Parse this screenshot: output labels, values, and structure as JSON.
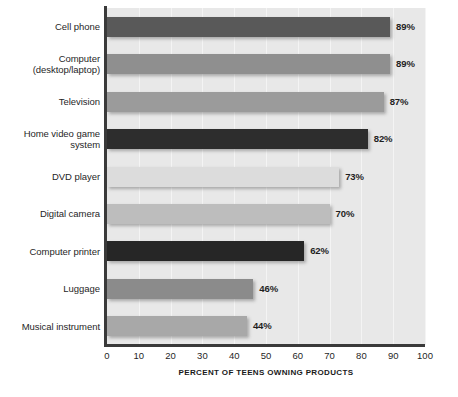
{
  "chart_data": {
    "type": "bar",
    "orientation": "horizontal",
    "title": "",
    "xlabel": "PERCENT OF TEENS OWNING PRODUCTS",
    "ylabel": "",
    "xlim": [
      0,
      100
    ],
    "xticks": [
      "0",
      "10",
      "20",
      "30",
      "40",
      "50",
      "60",
      "70",
      "80",
      "90",
      "100"
    ],
    "grid": true,
    "legend": "none",
    "value_suffix": "%",
    "categories": [
      "Cell phone",
      "Computer (desktop/laptop)",
      "Television",
      "Home video game system",
      "DVD player",
      "Digital camera",
      "Computer printer",
      "Luggage",
      "Musical instrument"
    ],
    "values": [
      89,
      89,
      87,
      82,
      73,
      70,
      62,
      46,
      44
    ],
    "value_labels": [
      "89%",
      "89%",
      "87%",
      "82%",
      "73%",
      "70%",
      "62%",
      "46%",
      "44%"
    ],
    "bars": [
      {
        "label_lines": [
          "Cell phone"
        ],
        "value": 89,
        "value_label": "89%",
        "color": "#595959"
      },
      {
        "label_lines": [
          "Computer",
          "(desktop/laptop)"
        ],
        "value": 89,
        "value_label": "89%",
        "color": "#8f8f8f"
      },
      {
        "label_lines": [
          "Television"
        ],
        "value": 87,
        "value_label": "87%",
        "color": "#9b9b9b"
      },
      {
        "label_lines": [
          "Home video game",
          "system"
        ],
        "value": 82,
        "value_label": "82%",
        "color": "#2d2d2d"
      },
      {
        "label_lines": [
          "DVD player"
        ],
        "value": 73,
        "value_label": "73%",
        "color": "#dcdcdc"
      },
      {
        "label_lines": [
          "Digital camera"
        ],
        "value": 70,
        "value_label": "70%",
        "color": "#bdbdbd"
      },
      {
        "label_lines": [
          "Computer printer"
        ],
        "value": 62,
        "value_label": "62%",
        "color": "#262626"
      },
      {
        "label_lines": [
          "Luggage"
        ],
        "value": 46,
        "value_label": "46%",
        "color": "#8b8b8b"
      },
      {
        "label_lines": [
          "Musical instrument"
        ],
        "value": 44,
        "value_label": "44%",
        "color": "#a8a8a8"
      }
    ],
    "colors": {
      "plot_background": "#e8e8e8",
      "gridline": "#f4f4f4",
      "axis": "#3a3a3a",
      "text": "#1f1f1f",
      "page_background": "#ffffff"
    }
  }
}
